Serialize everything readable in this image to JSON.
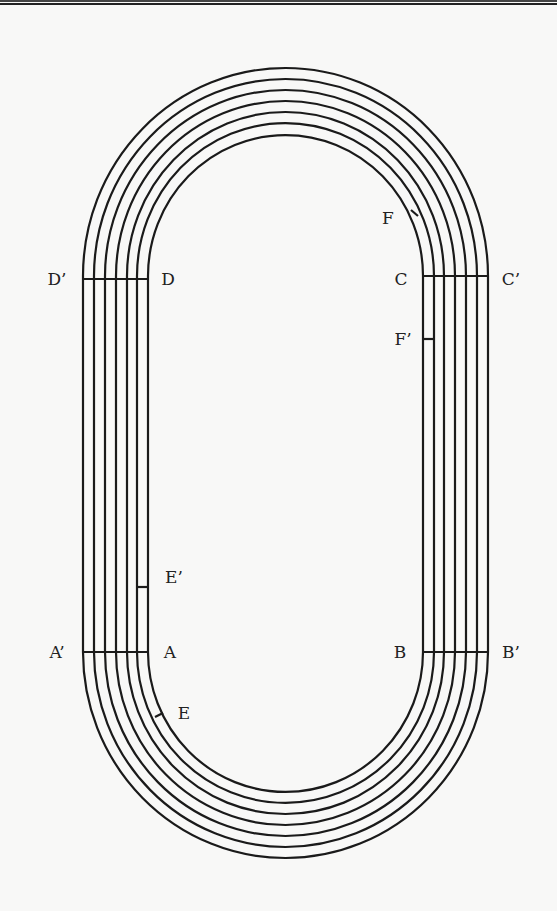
{
  "diagram": {
    "type": "running-track",
    "lanes": 6,
    "line_color": "#1a1a1a",
    "background": "#f8f8f7",
    "labels": {
      "D_prime": "D’",
      "D": "D",
      "C": "C",
      "C_prime": "C’",
      "F": "F",
      "F_prime": "F’",
      "E_prime": "E’",
      "A_prime": "A’",
      "A": "A",
      "B": "B",
      "B_prime": "B’",
      "E": "E"
    }
  }
}
